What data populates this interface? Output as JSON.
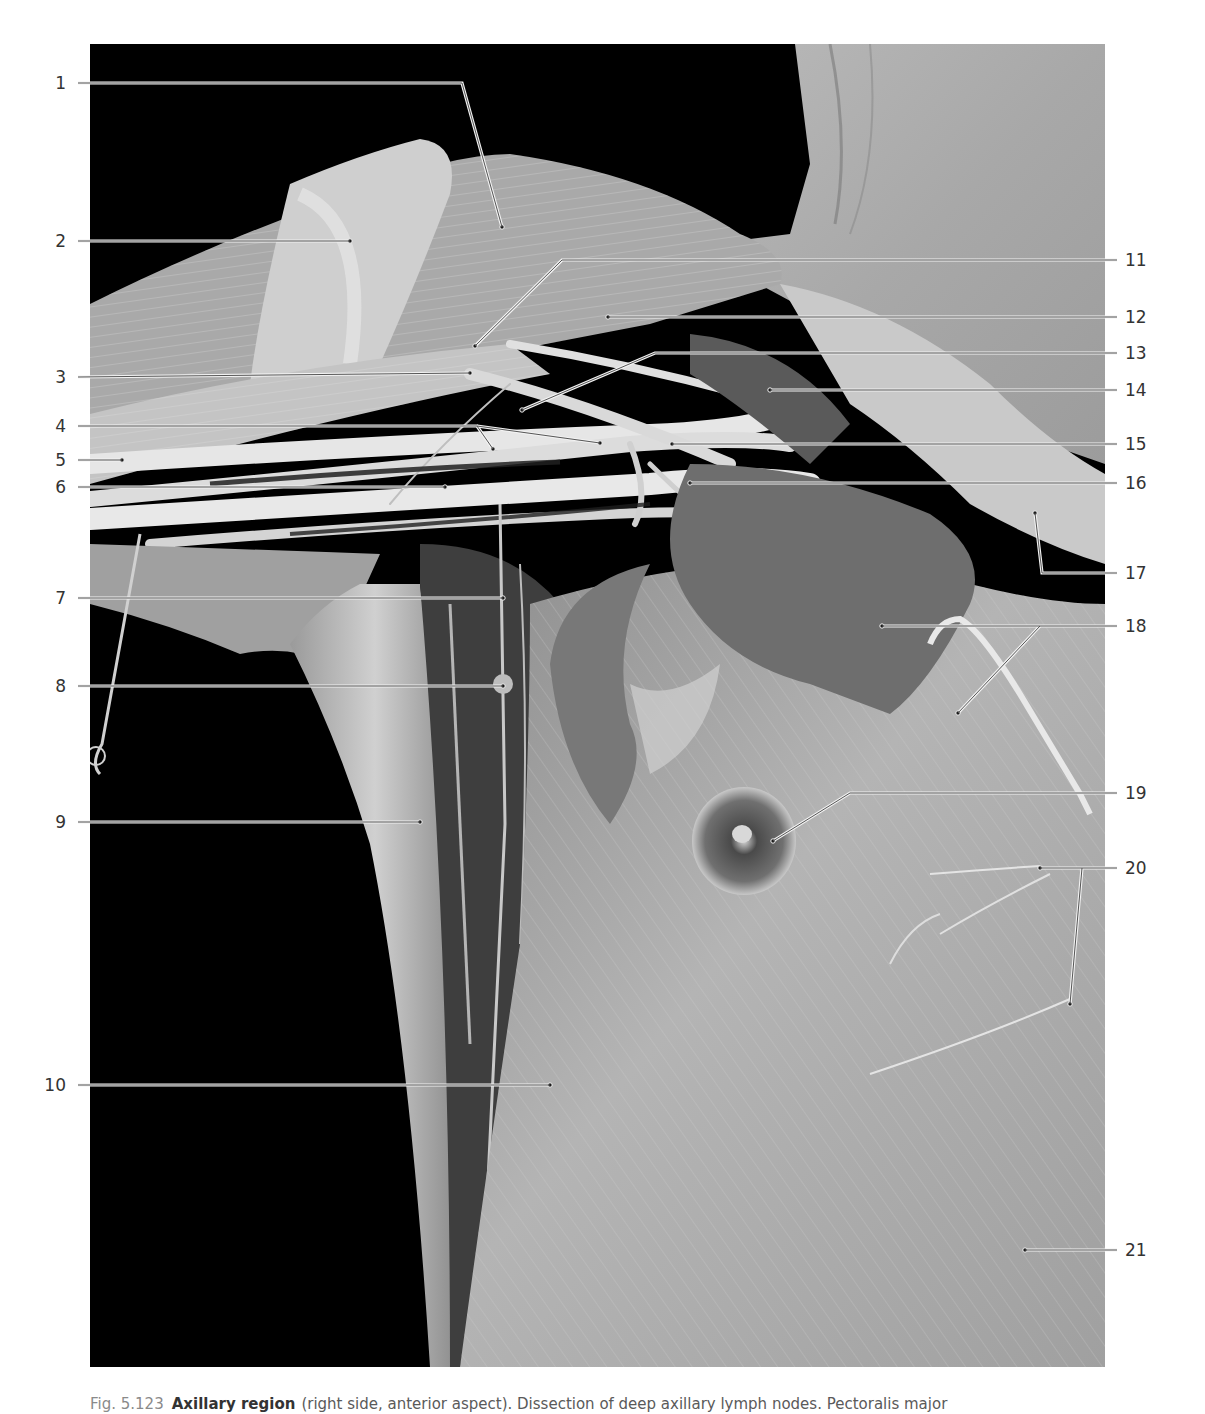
{
  "figure": {
    "number": "Fig. 5.123",
    "title": "Axillary region",
    "caption_text": "(right side, anterior aspect). Dissection of deep axillary lymph nodes. Pectoralis major",
    "photo_description": "Grayscale dissection photograph of the right axillary region, anterior view, showing arm, axillary vessels and nerves, pectoral muscles, nipple, and chest wall against a black background; a metal probe hook is visible on the left and a wire retractor on the right.",
    "colors": {
      "background": "#000000",
      "leader_line": "#e8e8e8",
      "leader_dot": "#1a1a1a",
      "label_text": "#333333",
      "page": "#ffffff"
    }
  },
  "labels_left": [
    {
      "number": "1"
    },
    {
      "number": "2"
    },
    {
      "number": "3"
    },
    {
      "number": "4"
    },
    {
      "number": "5"
    },
    {
      "number": "6"
    },
    {
      "number": "7"
    },
    {
      "number": "8"
    },
    {
      "number": "9"
    },
    {
      "number": "10"
    }
  ],
  "labels_right": [
    {
      "number": "11"
    },
    {
      "number": "12"
    },
    {
      "number": "13"
    },
    {
      "number": "14"
    },
    {
      "number": "15"
    },
    {
      "number": "16"
    },
    {
      "number": "17"
    },
    {
      "number": "18"
    },
    {
      "number": "19"
    },
    {
      "number": "20"
    },
    {
      "number": "21"
    }
  ]
}
